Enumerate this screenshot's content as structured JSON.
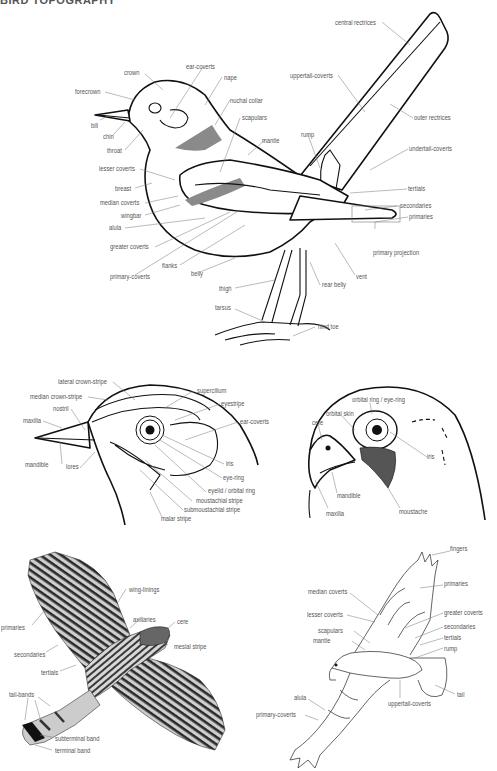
{
  "heading": "BIRD TOPOGRAPHY",
  "panels": {
    "songbird": {
      "title": "Perched songbird (side view)",
      "labels": {
        "crown": "crown",
        "ear_coverts": "ear-coverts",
        "nape": "nape",
        "forecrown": "forecrown",
        "nuchal_collar": "nuchal collar",
        "scapulars": "scapulars",
        "bill": "bill",
        "chin": "chin",
        "throat": "throat",
        "mantle": "mantle",
        "lesser_coverts": "lesser coverts",
        "breast": "breast",
        "median_coverts": "median coverts",
        "wingbar": "wingbar",
        "alula": "alula",
        "greater_coverts": "greater coverts",
        "primary_coverts": "primary-coverts",
        "flanks": "flanks",
        "belly": "belly",
        "thigh": "thigh",
        "tarsus": "tarsus",
        "central_rectrices": "central rectrices",
        "uppertail_coverts": "uppertail-coverts",
        "outer_rectrices": "outer rectrices",
        "rump": "rump",
        "undertail_coverts": "undertail-coverts",
        "tertials": "tertials",
        "secondaries": "secondaries",
        "primaries": "primaries",
        "primary_projection": "primary projection",
        "vent": "vent",
        "rear_belly": "rear belly",
        "hind_toe": "hind toe"
      }
    },
    "songbird_head": {
      "title": "Songbird head detail",
      "labels": {
        "lateral_crown_stripe": "lateral crown-stripe",
        "median_crown_stripe": "median crown-stripe",
        "supercilium": "supercilium",
        "nostril": "nostril",
        "eyestripe": "eyestripe",
        "maxilla": "maxilla",
        "ear_coverts": "ear-coverts",
        "mandible": "mandible",
        "lores": "lores",
        "iris": "iris",
        "eye_ring": "eye-ring",
        "eyelid": "eyelid / orbital ring",
        "moustachial_stripe": "moustachial stripe",
        "submoustachial_stripe": "submoustachial stripe",
        "malar_stripe": "malar stripe"
      }
    },
    "raptor_head": {
      "title": "Raptor head detail",
      "labels": {
        "orbital_ring": "orbital ring / eye-ring",
        "orbital_skin": "orbital skin",
        "cere": "cere",
        "iris": "iris",
        "mandible": "mandible",
        "maxilla": "maxilla",
        "moustache": "moustache"
      }
    },
    "hawk_underside": {
      "title": "Hawk in flight (underside)",
      "labels": {
        "wing_linings": "wing-linings",
        "axillaries": "axillaries",
        "cere": "cere",
        "primaries": "primaries",
        "mesial_stripe": "mesial stripe",
        "secondaries": "secondaries",
        "tertials": "tertials",
        "tail_bands": "tail-bands",
        "subterminal_band": "subterminal band",
        "terminal_band": "terminal band"
      }
    },
    "raptor_upperside": {
      "title": "Raptor in flight (upperside)",
      "labels": {
        "fingers": "fingers",
        "primaries": "primaries",
        "median_coverts": "median coverts",
        "lesser_coverts": "lesser coverts",
        "greater_coverts": "greater coverts",
        "secondaries": "secondaries",
        "scapulars": "scapulars",
        "tertials": "tertials",
        "mantle": "mantle",
        "rump": "rump",
        "tail": "tail",
        "alula": "alula",
        "primary_coverts": "primary-coverts",
        "uppertail_coverts": "uppertail-coverts"
      }
    }
  },
  "colors": {
    "outline": "#111111",
    "label_text": "#555555",
    "leader_line": "#777777",
    "patch_grey": "#8a8a8a"
  }
}
